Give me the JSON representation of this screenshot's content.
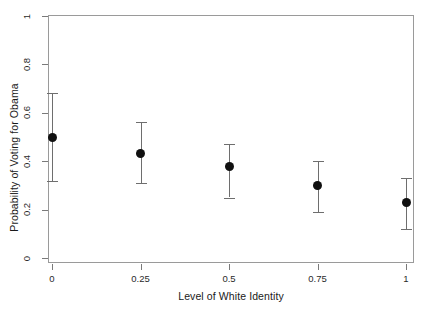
{
  "chart_data": {
    "type": "scatter",
    "title": "",
    "subtitle": "",
    "xlabel": "Level of White Identity",
    "ylabel": "Probability of Voting for Obama",
    "x": [
      0,
      0.25,
      0.5,
      0.75,
      1
    ],
    "xtick_labels": [
      "0",
      "0.25",
      "0.5",
      "0.75",
      "1"
    ],
    "ytick_labels": [
      "0",
      "0.2",
      "0.4",
      "0.6",
      "0.8",
      "1"
    ],
    "ytick_values": [
      0,
      0.2,
      0.4,
      0.6,
      0.8,
      1
    ],
    "values": [
      0.5,
      0.43,
      0.38,
      0.3,
      0.23
    ],
    "error_low": [
      0.32,
      0.31,
      0.25,
      0.19,
      0.12
    ],
    "error_high": [
      0.68,
      0.56,
      0.47,
      0.4,
      0.33
    ],
    "xlim": [
      -0.06,
      1.06
    ],
    "ylim": [
      -0.03,
      1.03
    ],
    "grid": false,
    "legend": "none",
    "marker": "filled-circle",
    "marker_color": "#101010",
    "errorbar_color": "#6e6e6e",
    "frame_color": "#9a9a9a",
    "background": "#ffffff",
    "series": [
      {
        "name": "Predicted probability",
        "points": [
          {
            "x": 0,
            "xlabel": "0",
            "y": 0.5,
            "lower": 0.32,
            "upper": 0.68
          },
          {
            "x": 0.25,
            "xlabel": "0.25",
            "y": 0.43,
            "lower": 0.31,
            "upper": 0.56
          },
          {
            "x": 0.5,
            "xlabel": "0.5",
            "y": 0.38,
            "lower": 0.25,
            "upper": 0.47
          },
          {
            "x": 0.75,
            "xlabel": "0.75",
            "y": 0.3,
            "lower": 0.19,
            "upper": 0.4
          },
          {
            "x": 1,
            "xlabel": "1",
            "y": 0.23,
            "lower": 0.12,
            "upper": 0.33
          }
        ]
      }
    ]
  }
}
